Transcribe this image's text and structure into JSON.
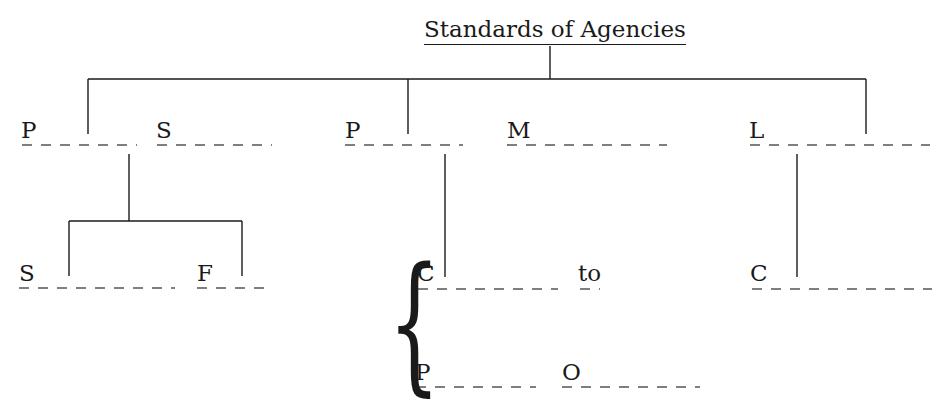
{
  "diagram": {
    "title": "Standards of Agencies",
    "level1": [
      {
        "id": "p1",
        "label": "P"
      },
      {
        "id": "s1",
        "label": "S"
      },
      {
        "id": "p2",
        "label": "P"
      },
      {
        "id": "m1",
        "label": "M"
      },
      {
        "id": "l1",
        "label": "L"
      }
    ],
    "level2_left": [
      {
        "id": "s2",
        "label": "S"
      },
      {
        "id": "f1",
        "label": "F"
      }
    ],
    "level2_middle": {
      "brace": "{",
      "rows": [
        {
          "first": "C",
          "second": "to"
        },
        {
          "first": "P",
          "second": "O"
        }
      ]
    },
    "level2_right": [
      {
        "id": "c2",
        "label": "C"
      }
    ],
    "line_color": "#1a1a1a",
    "dash_color": "#555555"
  }
}
